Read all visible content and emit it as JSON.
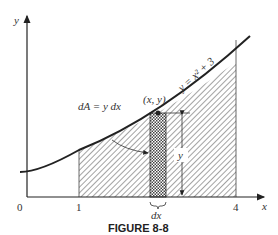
{
  "figure": {
    "caption": "FIGURE 8-8",
    "axis_labels": {
      "x": "x",
      "y": "y"
    },
    "ticks": {
      "origin": "0",
      "one": "1",
      "four": "4"
    },
    "curve_label": "y = x² + 3",
    "point_label": "(x, y)",
    "area_element_label": "dA = y dx",
    "height_label": "y",
    "width_label": "dx"
  }
}
